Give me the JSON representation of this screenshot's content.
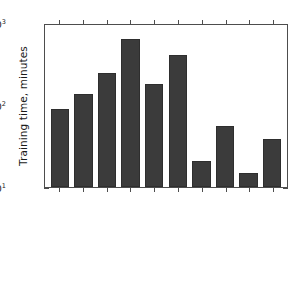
{
  "chart_data": {
    "type": "bar",
    "title": "",
    "xlabel": "",
    "ylabel": "Training time, minutes",
    "yscale": "log",
    "ylim": [
      10,
      1000
    ],
    "grid": false,
    "legend": null,
    "ytick_labels": [
      "10",
      "10",
      "10"
    ],
    "ytick_exponents": [
      "3",
      "2",
      "1"
    ],
    "ytick_values": [
      1000,
      100,
      10
    ],
    "categories": [
      "BOVF+RBF-NuSVC",
      "BOVF+Poly-NuSVC",
      "CNN-Avg (OpenMP)",
      "CNN-Avg-2 (OpenMP)",
      "CNN-Max (OpenMP)",
      "CNN-Max-2 (OpenMP)",
      "CNN-Avg (GPU)",
      "CNN-Avg-2 (GPU)",
      "CNN-Max (GPU)",
      "CNN-Max-2 (GPU)"
    ],
    "values": [
      89,
      135,
      245,
      630,
      180,
      410,
      20.5,
      56,
      15,
      38
    ],
    "bar_color": "#3b3b3b",
    "axis_color": "#4d4d4d",
    "background": "#ffffff"
  }
}
